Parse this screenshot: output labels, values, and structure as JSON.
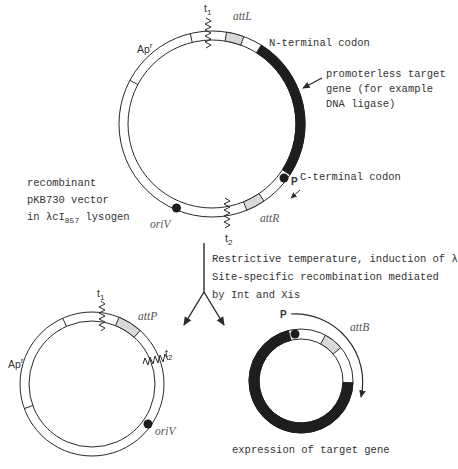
{
  "figure": {
    "top_plasmid": {
      "labels": {
        "t1": "t",
        "t1_sub": "1",
        "attL": "attL",
        "apr": "Ap",
        "apr_sup": "r",
        "n_terminal": "N-terminal codon",
        "gene_note": [
          "promoterless target",
          "gene (for example",
          "DNA ligase)"
        ],
        "p": "P",
        "c_terminal": "C-terminal codon",
        "attR": "attR",
        "oriV": "oriV",
        "t2": "t",
        "t2_sub": "2"
      },
      "caption": {
        "line1": "recombinant",
        "line2": "pKB730 vector",
        "line3_prefix": "in λcI",
        "line3_sub": "857",
        "line3_suffix": " lysogen"
      }
    },
    "transition": {
      "lines": [
        "Restrictive temperature, induction of λ",
        "Site-specific recombination mediated",
        "by Int and Xis"
      ]
    },
    "left_product": {
      "labels": {
        "t1": "t",
        "t1_sub": "1",
        "attP": "attP",
        "apr": "Ap",
        "apr_sup": "r",
        "t2": "t",
        "t2_sub": "2",
        "oriV": "oriV"
      }
    },
    "right_product": {
      "labels": {
        "p": "P",
        "attB": "attB"
      },
      "caption": "expression of target gene"
    },
    "colors": {
      "line": "#2a2a2a",
      "gene_fill": "#1e1e1e",
      "att_fill": "#d9d9d9",
      "background": "#ffffff"
    }
  }
}
